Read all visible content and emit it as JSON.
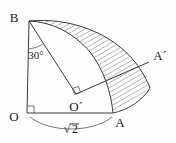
{
  "figure": {
    "type": "geometry-diagram",
    "width": 176,
    "height": 143,
    "background_color": "#fefefe",
    "line_color": "#3a3a3a",
    "hatch_color": "#5a5a5a"
  },
  "labels": {
    "origin": "O",
    "point_a": "A",
    "point_b": "B",
    "point_o_prime": "O´",
    "point_a_prime": "A´",
    "angle": "30°",
    "length": "√2",
    "length_radical_symbol": "√",
    "length_radicand": "2"
  },
  "points": {
    "O": {
      "x": 27,
      "y": 113
    },
    "A": {
      "x": 113,
      "y": 113
    },
    "B": {
      "x": 29,
      "y": 21
    },
    "O_prime": {
      "x": 76,
      "y": 94
    },
    "A_prime": {
      "x": 149,
      "y": 62
    }
  },
  "label_positions": {
    "O": {
      "x": 14,
      "y": 117
    },
    "A": {
      "x": 117,
      "y": 123
    },
    "B": {
      "x": 14,
      "y": 18
    },
    "O_prime": {
      "x": 70,
      "y": 108
    },
    "A_prime": {
      "x": 158,
      "y": 57
    },
    "angle": {
      "x": 27,
      "y": 55
    },
    "length": {
      "x": 70,
      "y": 130
    }
  },
  "annotations": {
    "right_angle_at_O": true,
    "right_angle_at_O_prime": true,
    "hatched_region": true,
    "hatch_spacing_px": 4,
    "hatch_angle_deg": 60
  },
  "geometry_notes": {
    "angle_value_deg": 30,
    "segment_OA_length_label": "√2",
    "arc_from_B_to_A": "quarter circle centered at O",
    "arc_from_B_to_A_prime": "rotated arc centered at O´"
  }
}
